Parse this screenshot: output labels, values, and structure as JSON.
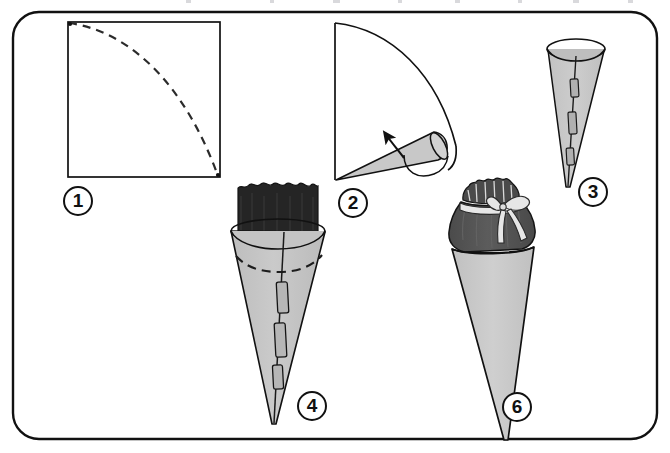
{
  "diagram": {
    "kind": "step-by-step craft illustration",
    "panel": {
      "shape": "rounded-rectangle",
      "border_color": "#111111",
      "fill_color": "#ffffff"
    },
    "palette": {
      "outline": "#111111",
      "paper_light_gray": "#c8c8c8",
      "paper_mid_gray": "#b4b4b4",
      "tissue_black": "#252525",
      "tissue_dark_gray": "#555555",
      "ribbon_light": "#e6e6e6",
      "background": "#ffffff",
      "scan_speck": "#d9d9dc"
    },
    "steps": [
      {
        "number": "1",
        "badge_label": "1",
        "name": "draw-quarter-circle-on-square",
        "description": "Square sheet of paper with a dashed quarter-circle arc drawn from the top-left corner to the bottom-right corner.",
        "elements": [
          "square outline",
          "dashed quarter-circle arc"
        ]
      },
      {
        "number": "2",
        "badge_label": "2",
        "name": "roll-quarter-circle-into-cone",
        "description": "The cut quarter-circle is rolled into a cone; a curved arrow shows the rolling direction.",
        "elements": [
          "quarter-circle sector outline",
          "gray rolled cone",
          "curved direction arrow"
        ]
      },
      {
        "number": "3",
        "badge_label": "3",
        "name": "tape-cone-seam",
        "description": "Finished gray cone standing point-down with an elliptical opening; the seam is held by three pieces of tape.",
        "elements": [
          "gray cone",
          "ellipse opening",
          "seam line",
          "3 tape strips"
        ]
      },
      {
        "number": "4",
        "badge_label": "4",
        "name": "line-cone-with-tissue-paper",
        "description": "Dark tissue paper is placed inside the cone so it sticks out above the rim; a dashed line marks the inner fold depth.",
        "elements": [
          "gray cone",
          "dark tissue collar",
          "dashed fold line",
          "seam line",
          "3 tape strips"
        ]
      },
      {
        "number": "6",
        "badge_label": "6",
        "name": "gather-and-tie-with-ribbon",
        "description": "The filled cone is closed by gathering the tissue paper at the neck and tying it with a ribbon bow.",
        "elements": [
          "gray cone",
          "dark gathered tissue top",
          "ruffled frill",
          "ribbon bow with two tails"
        ]
      }
    ],
    "badges": [
      {
        "label": "1",
        "name": "step-badge-1",
        "x": 63,
        "y": 186
      },
      {
        "label": "2",
        "name": "step-badge-2",
        "x": 338,
        "y": 188
      },
      {
        "label": "3",
        "name": "step-badge-3",
        "x": 578,
        "y": 177
      },
      {
        "label": "4",
        "name": "step-badge-4",
        "x": 297,
        "y": 391
      },
      {
        "label": "6",
        "name": "step-badge-6",
        "x": 502,
        "y": 392
      }
    ],
    "scan_specks": [
      {
        "x": 186,
        "w": 5
      },
      {
        "x": 270,
        "w": 4
      },
      {
        "x": 333,
        "w": 7
      },
      {
        "x": 398,
        "w": 4
      },
      {
        "x": 455,
        "w": 5
      },
      {
        "x": 518,
        "w": 4
      },
      {
        "x": 573,
        "w": 6
      },
      {
        "x": 628,
        "w": 5
      }
    ]
  }
}
